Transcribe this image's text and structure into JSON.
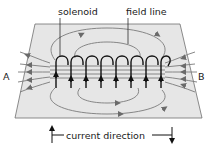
{
  "diagram": {
    "type": "physics-illustration",
    "labels": {
      "solenoid": "solenoid",
      "field_line": "field line",
      "end_a": "A",
      "end_b": "B",
      "current_direction": "current direction"
    },
    "coil_turns": 8,
    "colors": {
      "plane_fill": "#e6e6e6",
      "plane_edge": "#6e6e6e",
      "field_line": "#7a7a7a",
      "coil": "#111111",
      "text": "#1a1a1a"
    }
  }
}
